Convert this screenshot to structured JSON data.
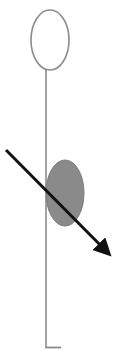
{
  "diagram": {
    "width": 124,
    "height": 358,
    "background": "#ffffff",
    "head": {
      "shape": "ellipse",
      "fill": "none",
      "stroke": "#8c8c8c",
      "cx": 50,
      "cy": 40,
      "rx": 19,
      "ry": 30
    },
    "stem": {
      "stroke": "#8c8c8c",
      "x": 46,
      "y1": 70,
      "y2": 348,
      "foot_x2": 61
    },
    "body": {
      "shape": "ellipse",
      "fill": "#8a8a8a",
      "stroke": "#7a7a7a",
      "cx": 65,
      "cy": 193,
      "rx": 19,
      "ry": 33
    },
    "arrow": {
      "stroke": "#111111",
      "x1": 6,
      "y1": 150,
      "x2": 114,
      "y2": 259,
      "width": 3
    },
    "labels": []
  }
}
